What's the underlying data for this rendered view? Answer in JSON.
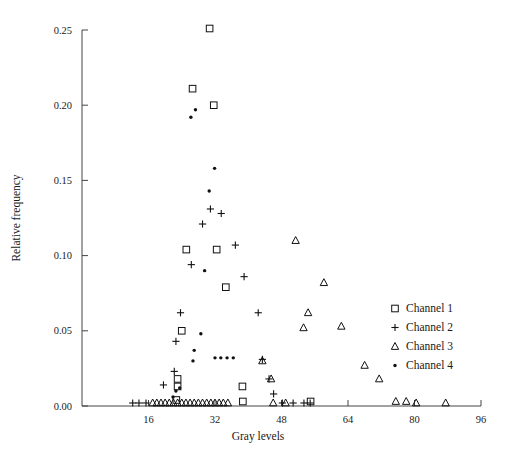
{
  "chart_data": {
    "type": "scatter",
    "title": "",
    "xlabel": "Gray levels",
    "ylabel": "Relative frequency",
    "xlim": [
      0,
      96
    ],
    "ylim": [
      0.0,
      0.25
    ],
    "xticks": [
      16,
      32,
      48,
      64,
      80,
      96
    ],
    "xticklabels": [
      "16",
      "32",
      "48",
      "64",
      "80",
      "96"
    ],
    "yticks": [
      0.0,
      0.05,
      0.1,
      0.15,
      0.2,
      0.25
    ],
    "yticklabels": [
      "0.00",
      "0.05",
      "0.10",
      "0.15",
      "0.20",
      "0.25"
    ],
    "grid": false,
    "legend_position": "right-lower",
    "series": [
      {
        "name": "Channel 1",
        "marker": "square",
        "points": [
          [
            22.7,
            0.004
          ],
          [
            23.0,
            0.013
          ],
          [
            23.0,
            0.018
          ],
          [
            24.0,
            0.05
          ],
          [
            25.1,
            0.104
          ],
          [
            26.6,
            0.211
          ],
          [
            30.7,
            0.251
          ],
          [
            31.7,
            0.2
          ],
          [
            32.4,
            0.104
          ],
          [
            34.6,
            0.079
          ],
          [
            38.6,
            0.013
          ],
          [
            38.7,
            0.003
          ],
          [
            55.0,
            0.003
          ]
        ]
      },
      {
        "name": "Channel 2",
        "marker": "plus",
        "points": [
          [
            12.2,
            0.002
          ],
          [
            13.7,
            0.002
          ],
          [
            15.4,
            0.002
          ],
          [
            19.6,
            0.014
          ],
          [
            22.2,
            0.023
          ],
          [
            22.6,
            0.043
          ],
          [
            23.7,
            0.062
          ],
          [
            26.3,
            0.094
          ],
          [
            29.0,
            0.121
          ],
          [
            30.9,
            0.131
          ],
          [
            33.5,
            0.128
          ],
          [
            36.9,
            0.107
          ],
          [
            39.0,
            0.086
          ],
          [
            42.4,
            0.062
          ],
          [
            43.4,
            0.031
          ],
          [
            45.0,
            0.018
          ],
          [
            46.1,
            0.008
          ],
          [
            48.2,
            0.002
          ],
          [
            50.8,
            0.002
          ],
          [
            53.4,
            0.002
          ],
          [
            54.9,
            0.002
          ]
        ]
      },
      {
        "name": "Channel 3",
        "marker": "triangle",
        "points": [
          [
            17.0,
            0.002
          ],
          [
            18.0,
            0.002
          ],
          [
            19.0,
            0.002
          ],
          [
            20.0,
            0.002
          ],
          [
            21.0,
            0.002
          ],
          [
            22.0,
            0.002
          ],
          [
            23.0,
            0.002
          ],
          [
            24.0,
            0.002
          ],
          [
            25.0,
            0.002
          ],
          [
            26.0,
            0.002
          ],
          [
            27.0,
            0.002
          ],
          [
            28.0,
            0.002
          ],
          [
            29.0,
            0.002
          ],
          [
            30.0,
            0.002
          ],
          [
            31.0,
            0.002
          ],
          [
            32.0,
            0.002
          ],
          [
            33.0,
            0.002
          ],
          [
            34.0,
            0.002
          ],
          [
            35.1,
            0.002
          ],
          [
            43.4,
            0.03
          ],
          [
            45.5,
            0.018
          ],
          [
            46.0,
            0.002
          ],
          [
            49.0,
            0.002
          ],
          [
            53.3,
            0.052
          ],
          [
            54.4,
            0.062
          ],
          [
            51.4,
            0.11
          ],
          [
            58.2,
            0.082
          ],
          [
            62.4,
            0.053
          ],
          [
            68.0,
            0.027
          ],
          [
            71.5,
            0.018
          ],
          [
            75.5,
            0.003
          ],
          [
            78.0,
            0.003
          ],
          [
            80.4,
            0.002
          ],
          [
            87.5,
            0.002
          ]
        ]
      },
      {
        "name": "Channel 4",
        "marker": "dot",
        "points": [
          [
            21.9,
            0.006
          ],
          [
            22.6,
            0.01
          ],
          [
            23.5,
            0.012
          ],
          [
            26.7,
            0.03
          ],
          [
            27.0,
            0.037
          ],
          [
            28.6,
            0.048
          ],
          [
            29.5,
            0.09
          ],
          [
            30.6,
            0.143
          ],
          [
            31.9,
            0.158
          ],
          [
            26.2,
            0.192
          ],
          [
            27.3,
            0.197
          ],
          [
            33.4,
            0.032
          ],
          [
            34.9,
            0.032
          ],
          [
            36.4,
            0.032
          ],
          [
            32.0,
            0.032
          ]
        ]
      }
    ]
  },
  "legend": {
    "entries": [
      {
        "label": "Channel 1",
        "marker": "square"
      },
      {
        "label": "Channel 2",
        "marker": "plus"
      },
      {
        "label": "Channel 3",
        "marker": "triangle"
      },
      {
        "label": "Channel 4",
        "marker": "dot"
      }
    ]
  }
}
